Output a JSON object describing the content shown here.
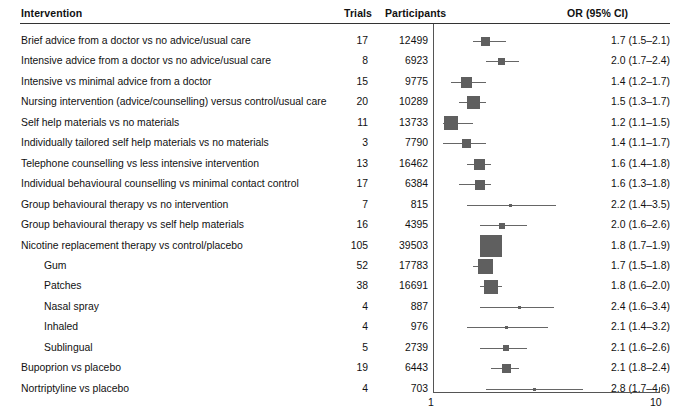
{
  "header": {
    "intervention": "Intervention",
    "trials": "Trials",
    "participants": "Participants",
    "or_ci": "OR (95% CI)"
  },
  "axis": {
    "left_label": "1",
    "right_label": "10",
    "min": 1,
    "max": 10,
    "scale": "log"
  },
  "colors": {
    "marker": "#5f5f5f",
    "ci_line": "#666666",
    "rule": "#333333",
    "text": "#111111"
  },
  "chart_data": {
    "type": "table",
    "title": "",
    "xlabel": "",
    "ylabel": "",
    "xlim": [
      1,
      10
    ],
    "scale": "log",
    "grid": false,
    "legend": "none",
    "columns": [
      "Intervention",
      "Trials",
      "Participants",
      "OR (95% CI)"
    ],
    "rows": [
      {
        "label": "Brief advice from a doctor vs no advice/usual care",
        "indent": 0,
        "trials": "17",
        "participants": "12499",
        "or_ci": "1.7 (1.5–2.1)",
        "or": 1.7,
        "lo": 1.5,
        "hi": 2.1,
        "box": 9
      },
      {
        "label": "Intensive advice from a doctor vs no advice/usual care",
        "indent": 0,
        "trials": "8",
        "participants": "6923",
        "or_ci": "2.0 (1.7–2.4)",
        "or": 2.0,
        "lo": 1.7,
        "hi": 2.4,
        "box": 7
      },
      {
        "label": "Intensive vs minimal advice from a doctor",
        "indent": 0,
        "trials": "15",
        "participants": "9775",
        "or_ci": "1.4 (1.2–1.7)",
        "or": 1.4,
        "lo": 1.2,
        "hi": 1.7,
        "box": 11
      },
      {
        "label": "Nursing intervention (advice/counselling) versus control/usual care",
        "indent": 0,
        "trials": "20",
        "participants": "10289",
        "or_ci": "1.5 (1.3–1.7)",
        "or": 1.5,
        "lo": 1.3,
        "hi": 1.7,
        "box": 13
      },
      {
        "label": "Self help materials vs no materials",
        "indent": 0,
        "trials": "11",
        "participants": "13733",
        "or_ci": "1.2 (1.1–1.5)",
        "or": 1.2,
        "lo": 1.1,
        "hi": 1.5,
        "box": 14
      },
      {
        "label": "Individually tailored self help materials vs no materials",
        "indent": 0,
        "trials": "3",
        "participants": "7790",
        "or_ci": "1.4 (1.1–1.7)",
        "or": 1.4,
        "lo": 1.1,
        "hi": 1.7,
        "box": 9
      },
      {
        "label": "Telephone counselling vs less intensive intervention",
        "indent": 0,
        "trials": "13",
        "participants": "16462",
        "or_ci": "1.6 (1.4–1.8)",
        "or": 1.6,
        "lo": 1.4,
        "hi": 1.8,
        "box": 11
      },
      {
        "label": "Individual behavioural counselling vs minimal contact control",
        "indent": 0,
        "trials": "17",
        "participants": "6384",
        "or_ci": "1.6 (1.3–1.8)",
        "or": 1.6,
        "lo": 1.3,
        "hi": 1.8,
        "box": 10
      },
      {
        "label": "Group behavioural therapy vs no intervention",
        "indent": 0,
        "trials": "7",
        "participants": "815",
        "or_ci": "2.2 (1.4–3.5)",
        "or": 2.2,
        "lo": 1.4,
        "hi": 3.5,
        "box": 3
      },
      {
        "label": "Group behavioural therapy vs self help materials",
        "indent": 0,
        "trials": "16",
        "participants": "4395",
        "or_ci": "2.0 (1.6–2.6)",
        "or": 2.0,
        "lo": 1.6,
        "hi": 2.6,
        "box": 6
      },
      {
        "label": "Nicotine replacement therapy vs control/placebo",
        "indent": 0,
        "trials": "105",
        "participants": "39503",
        "or_ci": "1.8 (1.7–1.9)",
        "or": 1.8,
        "lo": 1.7,
        "hi": 1.9,
        "box": 22
      },
      {
        "label": "Gum",
        "indent": 1,
        "trials": "52",
        "participants": "17783",
        "or_ci": "1.7 (1.5–1.8)",
        "or": 1.7,
        "lo": 1.5,
        "hi": 1.8,
        "box": 15
      },
      {
        "label": "Patches",
        "indent": 1,
        "trials": "38",
        "participants": "16691",
        "or_ci": "1.8 (1.6–2.0)",
        "or": 1.8,
        "lo": 1.6,
        "hi": 2.0,
        "box": 14
      },
      {
        "label": "Nasal spray",
        "indent": 1,
        "trials": "4",
        "participants": "887",
        "or_ci": "2.4 (1.6–3.4)",
        "or": 2.4,
        "lo": 1.6,
        "hi": 3.4,
        "box": 3
      },
      {
        "label": "Inhaled",
        "indent": 1,
        "trials": "4",
        "participants": "976",
        "or_ci": "2.1 (1.4–3.2)",
        "or": 2.1,
        "lo": 1.4,
        "hi": 3.2,
        "box": 3
      },
      {
        "label": "Sublingual",
        "indent": 1,
        "trials": "5",
        "participants": "2739",
        "or_ci": "2.1 (1.6–2.6)",
        "or": 2.1,
        "lo": 1.6,
        "hi": 2.6,
        "box": 6
      },
      {
        "label": "Bupoprion vs placebo",
        "indent": 0,
        "trials": "19",
        "participants": "6443",
        "or_ci": "2.1 (1.8–2.4)",
        "or": 2.1,
        "lo": 1.8,
        "hi": 2.4,
        "box": 9
      },
      {
        "label": "Nortriptyline vs placebo",
        "indent": 0,
        "trials": "4",
        "participants": "703",
        "or_ci": "2.8 (1.7–4.6)",
        "or": 2.8,
        "lo": 1.7,
        "hi": 4.6,
        "box": 3
      }
    ]
  }
}
